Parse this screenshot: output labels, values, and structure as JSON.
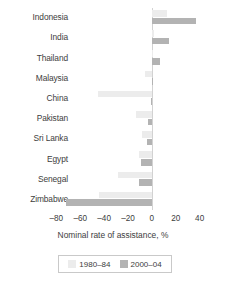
{
  "chart_data": {
    "type": "bar",
    "orientation": "horizontal",
    "title": "",
    "xlabel": "Nominal rate of assistance, %",
    "ylabel": "",
    "xlim": [
      -87,
      47
    ],
    "xticks": [
      -80,
      -60,
      -40,
      -20,
      0,
      20,
      40
    ],
    "xtick_labels": [
      "–80",
      "–60",
      "–40",
      "–20",
      "0",
      "20",
      "40"
    ],
    "grid": false,
    "legend_position": "bottom",
    "categories": [
      "Indonesia",
      "India",
      "Thailand",
      "Malaysia",
      "China",
      "Pakistan",
      "Sri Lanka",
      "Egypt",
      "Senegal",
      "Zimbabwe"
    ],
    "series": [
      {
        "name": "1980–84",
        "color": "#ececec",
        "values": [
          13,
          2,
          0.5,
          -6,
          -45,
          -13,
          -8,
          -11,
          -28,
          -44
        ]
      },
      {
        "name": "2000–04",
        "color": "#b3b3b3",
        "values": [
          37,
          14,
          7,
          1,
          -0.5,
          -3,
          -4,
          -9,
          -11,
          -72
        ]
      }
    ]
  },
  "legend": {
    "entries": [
      {
        "label": "1980–84"
      },
      {
        "label": "2000–04"
      }
    ]
  }
}
